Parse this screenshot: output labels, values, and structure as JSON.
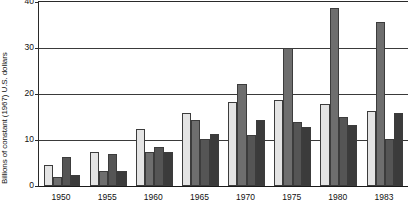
{
  "chart_data": {
    "type": "bar",
    "title": "",
    "subtitle": "",
    "xlabel": "",
    "ylabel": "Billions of constant (1967) U.S. dollars",
    "categories": [
      "1950",
      "1955",
      "1960",
      "1965",
      "1970",
      "1975",
      "1980",
      "1983"
    ],
    "yticks": [
      0,
      10,
      20,
      30,
      40
    ],
    "ylim": [
      0,
      40
    ],
    "grid": "horizontal",
    "legend": "none",
    "series": [
      {
        "name": "series-1",
        "color": "#e4e4e4",
        "values": [
          4.5,
          7.5,
          12.3,
          15.9,
          18.3,
          18.6,
          17.9,
          16.3
        ]
      },
      {
        "name": "series-2",
        "color": "#6e6e6e",
        "values": [
          2.0,
          3.2,
          7.3,
          14.4,
          22.2,
          30.0,
          38.7,
          35.6
        ]
      },
      {
        "name": "series-3",
        "color": "#555555",
        "values": [
          6.3,
          7.0,
          8.4,
          10.3,
          11.0,
          14.0,
          15.0,
          10.3
        ]
      },
      {
        "name": "series-4",
        "color": "#3b3b3b",
        "values": [
          2.3,
          3.3,
          7.3,
          11.4,
          14.4,
          12.8,
          13.2,
          15.8
        ]
      }
    ]
  }
}
